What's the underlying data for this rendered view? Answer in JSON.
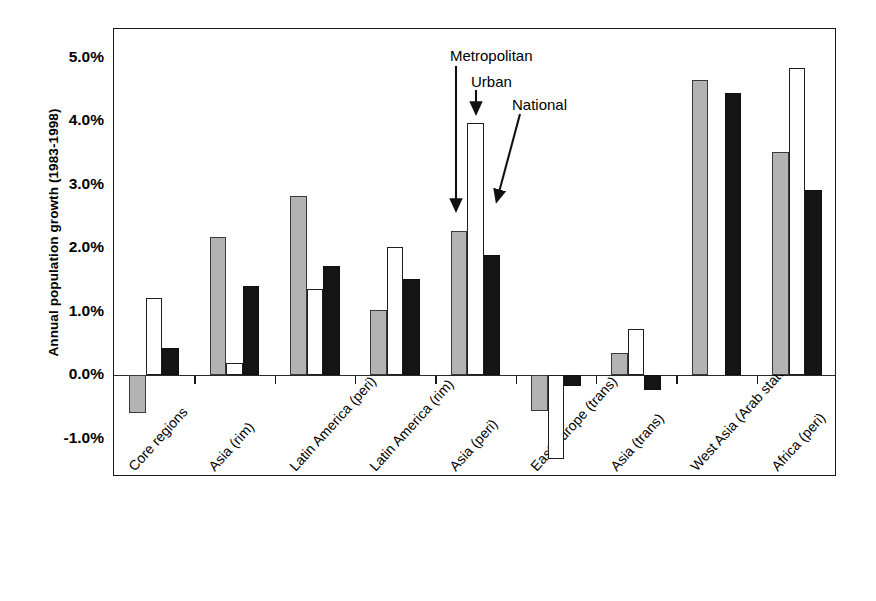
{
  "chart_data": {
    "type": "bar",
    "title": "",
    "xlabel": "",
    "ylabel": "Annual population growth (1983-1998)",
    "ylim": [
      -1.6,
      5.45
    ],
    "ytick_values": [
      5.0,
      4.0,
      3.0,
      2.0,
      1.0,
      0.0,
      -1.0
    ],
    "ytick_labels": [
      "5.0%",
      "4.0%",
      "3.0%",
      "2.0%",
      "1.0%",
      "0.0%",
      "-1.0%"
    ],
    "grid": false,
    "legend_position": "none",
    "categories": [
      "Core regions",
      "Asia (rim)",
      "Latin America (peri)",
      "Latin America (rim)",
      "Asia (peri)",
      "East Europe (trans)",
      "Asia (trans)",
      "West Asia (Arab states)",
      "Africa (peri)"
    ],
    "series": [
      {
        "name": "Metropolitan",
        "color": "#b3b3b3",
        "values": [
          -0.6,
          2.17,
          2.82,
          1.03,
          2.27,
          -0.56,
          0.35,
          4.64,
          3.52
        ]
      },
      {
        "name": "Urban",
        "color": "#ffffff",
        "values": [
          1.22,
          0.2,
          1.36,
          2.02,
          3.97,
          -1.32,
          0.73,
          null,
          4.83
        ]
      },
      {
        "name": "National",
        "color": "#151515",
        "values": [
          0.43,
          1.4,
          1.72,
          1.52,
          1.89,
          -0.17,
          -0.23,
          4.45,
          2.91
        ]
      }
    ],
    "annotations": [
      {
        "text": "Metropolitan",
        "target_series": "Metropolitan",
        "target_category": "Asia (peri)"
      },
      {
        "text": "Urban",
        "target_series": "Urban",
        "target_category": "Asia (peri)"
      },
      {
        "text": "National",
        "target_series": "National",
        "target_category": "Asia (peri)"
      }
    ]
  }
}
